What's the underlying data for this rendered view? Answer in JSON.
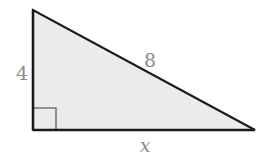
{
  "diagram": {
    "type": "right-triangle",
    "colors": {
      "fill": "#ebebeb",
      "stroke": "#1a1a1a",
      "label": "#8a8a8a",
      "right_angle_marker": "#555555"
    },
    "vertices": {
      "top": [
        33,
        10
      ],
      "right_angle": [
        33,
        130
      ],
      "right": [
        255,
        130
      ]
    },
    "labels": {
      "vertical_leg": "4",
      "hypotenuse": "8",
      "horizontal_leg": "x"
    },
    "right_angle_marker": true
  }
}
